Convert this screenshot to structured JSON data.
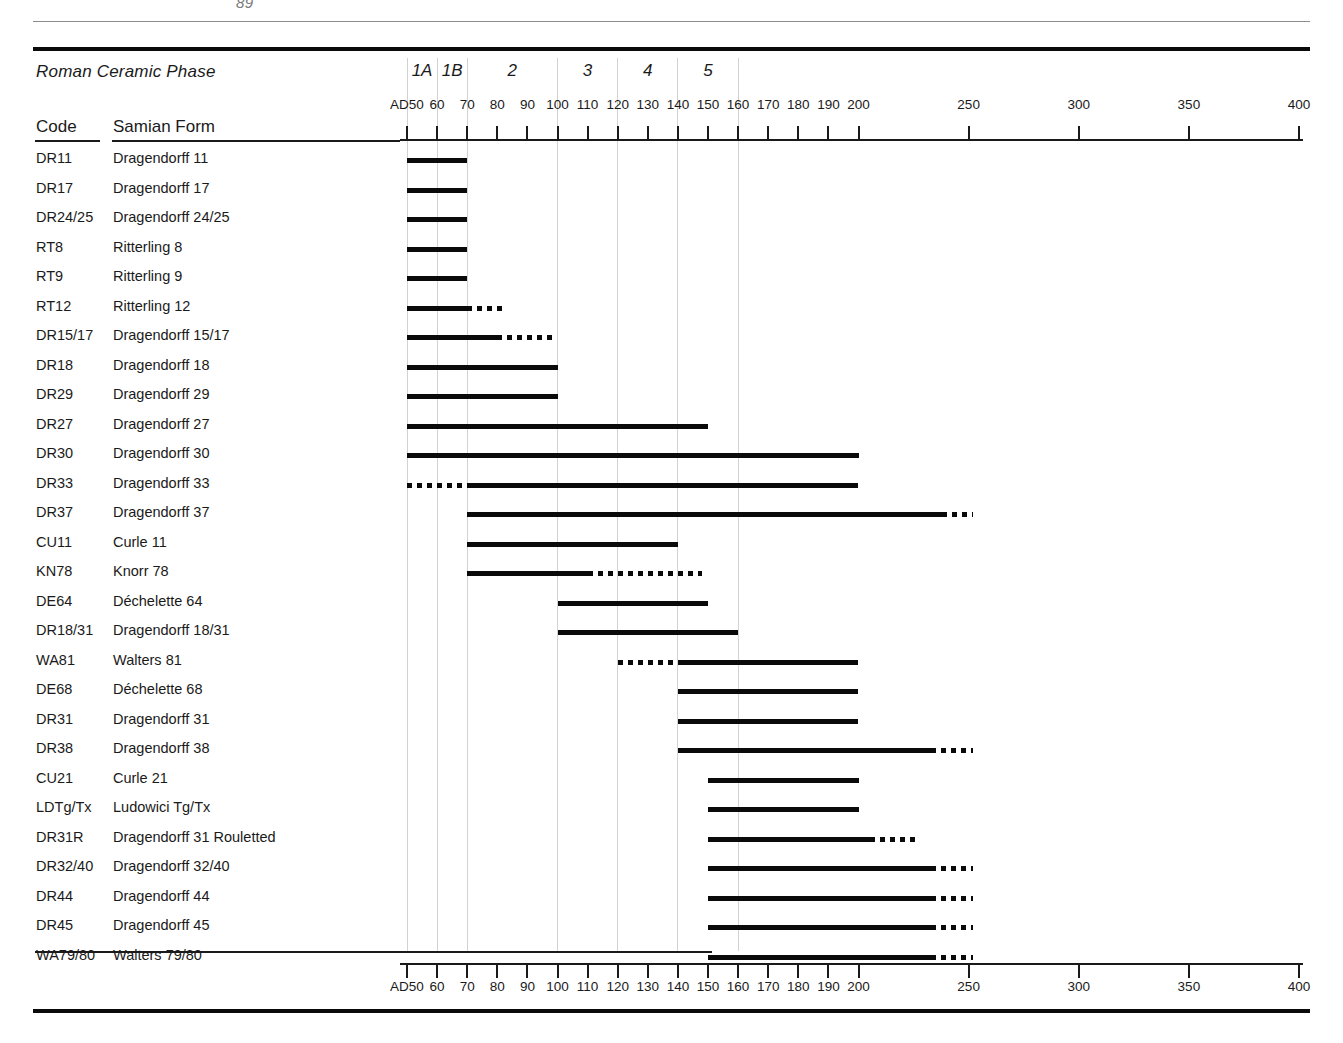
{
  "page": {
    "header_fragment": "89"
  },
  "table": {
    "phase_row_label": "Roman Ceramic Phase",
    "col_code": "Code",
    "col_form": "Samian Form"
  },
  "phases": [
    {
      "label": "1A",
      "start": 50,
      "end": 60
    },
    {
      "label": "1B",
      "start": 60,
      "end": 70
    },
    {
      "label": "2",
      "start": 70,
      "end": 100
    },
    {
      "label": "3",
      "start": 100,
      "end": 120
    },
    {
      "label": "4",
      "start": 120,
      "end": 140
    },
    {
      "label": "5",
      "start": 140,
      "end": 160
    }
  ],
  "phase_boundaries": [
    50,
    60,
    70,
    100,
    120,
    140,
    160
  ],
  "axis": {
    "first_tick_label": "AD50",
    "ticks_decade": [
      50,
      60,
      70,
      80,
      90,
      100,
      110,
      120,
      130,
      140,
      150,
      160,
      170,
      180,
      190,
      200
    ],
    "ticks_half_century": [
      250,
      300,
      350,
      400
    ],
    "tick_labels": [
      "AD50",
      "60",
      "70",
      "80",
      "90",
      "100",
      "110",
      "120",
      "130",
      "140",
      "150",
      "160",
      "170",
      "180",
      "190",
      "200",
      "250",
      "300",
      "350",
      "400"
    ],
    "range_start": 50,
    "range_end": 400,
    "break_at": 200
  },
  "chart_data": {
    "type": "bar",
    "xlabel": "Years AD",
    "ylabel": "Samian Form",
    "xlim": [
      50,
      400
    ],
    "grid": true,
    "legend": "",
    "note": "Solid segment = firm date range; dotted segment = uncertain/extended range",
    "categories": [
      "DR11",
      "DR17",
      "DR24/25",
      "RT8",
      "RT9",
      "RT12",
      "DR15/17",
      "DR18",
      "DR29",
      "DR27",
      "DR30",
      "DR33",
      "DR37",
      "CU11",
      "KN78",
      "DE64",
      "DR18/31",
      "WA81",
      "DE68",
      "DR31",
      "DR38",
      "CU21",
      "LDTg/Tx",
      "DR31R",
      "DR32/40",
      "DR44",
      "DR45",
      "WA79/80"
    ],
    "rows": [
      {
        "code": "DR11",
        "form": "Dragendorff 11",
        "solid": [
          50,
          70
        ],
        "dotted_before": null,
        "dotted_after": null
      },
      {
        "code": "DR17",
        "form": "Dragendorff 17",
        "solid": [
          50,
          70
        ],
        "dotted_before": null,
        "dotted_after": null
      },
      {
        "code": "DR24/25",
        "form": "Dragendorff 24/25",
        "solid": [
          50,
          70
        ],
        "dotted_before": null,
        "dotted_after": null
      },
      {
        "code": "RT8",
        "form": "Ritterling 8",
        "solid": [
          50,
          70
        ],
        "dotted_before": null,
        "dotted_after": null
      },
      {
        "code": "RT9",
        "form": "Ritterling 9",
        "solid": [
          50,
          70
        ],
        "dotted_before": null,
        "dotted_after": null
      },
      {
        "code": "RT12",
        "form": "Ritterling 12",
        "solid": [
          50,
          70
        ],
        "dotted_before": null,
        "dotted_after": [
          70,
          82
        ]
      },
      {
        "code": "DR15/17",
        "form": "Dragendorff 15/17",
        "solid": [
          50,
          80
        ],
        "dotted_before": null,
        "dotted_after": [
          80,
          100
        ]
      },
      {
        "code": "DR18",
        "form": "Dragendorff 18",
        "solid": [
          50,
          100
        ],
        "dotted_before": null,
        "dotted_after": null
      },
      {
        "code": "DR29",
        "form": "Dragendorff 29",
        "solid": [
          50,
          100
        ],
        "dotted_before": null,
        "dotted_after": null
      },
      {
        "code": "DR27",
        "form": "Dragendorff 27",
        "solid": [
          50,
          150
        ],
        "dotted_before": null,
        "dotted_after": null
      },
      {
        "code": "DR30",
        "form": "Dragendorff 30",
        "solid": [
          50,
          200
        ],
        "dotted_before": null,
        "dotted_after": null
      },
      {
        "code": "DR33",
        "form": "Dragendorff 33",
        "solid": [
          70,
          200
        ],
        "dotted_before": [
          50,
          70
        ],
        "dotted_after": null
      },
      {
        "code": "DR37",
        "form": "Dragendorff 37",
        "solid": [
          70,
          238
        ],
        "dotted_before": null,
        "dotted_after": [
          238,
          252
        ]
      },
      {
        "code": "CU11",
        "form": "Curle 11",
        "solid": [
          70,
          140
        ],
        "dotted_before": null,
        "dotted_after": null
      },
      {
        "code": "KN78",
        "form": "Knorr 78",
        "solid": [
          70,
          110
        ],
        "dotted_before": null,
        "dotted_after": [
          110,
          148
        ]
      },
      {
        "code": "DE64",
        "form": "Déchelette 64",
        "solid": [
          100,
          150
        ],
        "dotted_before": null,
        "dotted_after": null
      },
      {
        "code": "DR18/31",
        "form": "Dragendorff 18/31",
        "solid": [
          100,
          160
        ],
        "dotted_before": null,
        "dotted_after": null
      },
      {
        "code": "WA81",
        "form": "Walters 81",
        "solid": [
          140,
          200
        ],
        "dotted_before": [
          120,
          140
        ],
        "dotted_after": null
      },
      {
        "code": "DE68",
        "form": "Déchelette 68",
        "solid": [
          140,
          200
        ],
        "dotted_before": null,
        "dotted_after": null
      },
      {
        "code": "DR31",
        "form": "Dragendorff 31",
        "solid": [
          140,
          200
        ],
        "dotted_before": null,
        "dotted_after": null
      },
      {
        "code": "DR38",
        "form": "Dragendorff 38",
        "solid": [
          140,
          233
        ],
        "dotted_before": null,
        "dotted_after": [
          233,
          252
        ]
      },
      {
        "code": "CU21",
        "form": "Curle 21",
        "solid": [
          150,
          200
        ],
        "dotted_before": null,
        "dotted_after": null
      },
      {
        "code": "LDTg/Tx",
        "form": "Ludowici Tg/Tx",
        "solid": [
          150,
          200
        ],
        "dotted_before": null,
        "dotted_after": null
      },
      {
        "code": "DR31R",
        "form": "Dragendorff 31 Rouletted",
        "solid": [
          150,
          205
        ],
        "dotted_before": null,
        "dotted_after": [
          205,
          226
        ]
      },
      {
        "code": "DR32/40",
        "form": "Dragendorff 32/40",
        "solid": [
          150,
          233
        ],
        "dotted_before": null,
        "dotted_after": [
          233,
          252
        ]
      },
      {
        "code": "DR44",
        "form": "Dragendorff 44",
        "solid": [
          150,
          233
        ],
        "dotted_before": null,
        "dotted_after": [
          233,
          252
        ]
      },
      {
        "code": "DR45",
        "form": "Dragendorff 45",
        "solid": [
          150,
          233
        ],
        "dotted_before": null,
        "dotted_after": [
          233,
          252
        ]
      },
      {
        "code": "WA79/80",
        "form": "Walters 79/80",
        "solid": [
          150,
          233
        ],
        "dotted_before": null,
        "dotted_after": [
          233,
          252
        ]
      }
    ]
  }
}
